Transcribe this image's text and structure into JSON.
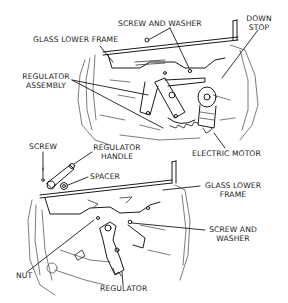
{
  "diagram": {
    "upper_view": {
      "labels": {
        "screw_and_washer": "SCREW AND WASHER",
        "down_stop_1": "DOWN",
        "down_stop_2": "STOP",
        "glass_lower_frame": "GLASS LOWER FRAME",
        "regulator_assembly_1": "REGULATOR",
        "regulator_assembly_2": "ASSEMBLY",
        "electric_motor": "ELECTRIC MOTOR"
      }
    },
    "lower_view": {
      "labels": {
        "screw": "SCREW",
        "regulator_handle_1": "REGULATOR",
        "regulator_handle_2": "HANDLE",
        "spacer": "SPACER",
        "glass_lower_frame_1": "GLASS LOWER",
        "glass_lower_frame_2": "FRAME",
        "screw_and_washer_1": "SCREW AND",
        "screw_and_washer_2": "WASHER",
        "nut": "NUT",
        "regulator": "REGULATOR"
      }
    },
    "colors": {
      "line": "#1a1a1a",
      "background": "#ffffff"
    }
  }
}
